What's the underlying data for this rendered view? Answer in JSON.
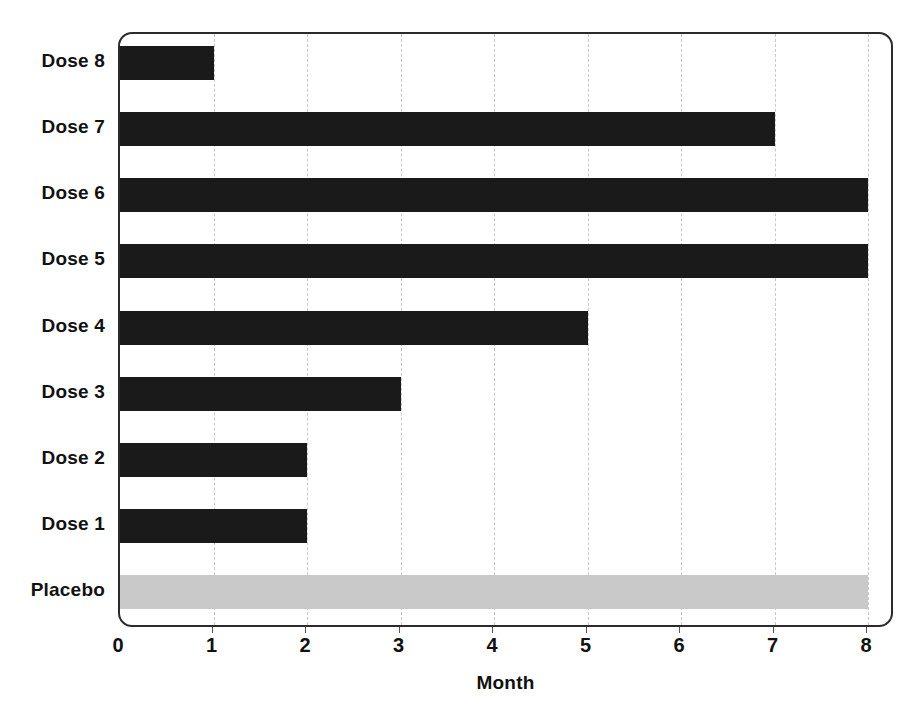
{
  "chart_data": {
    "type": "bar",
    "orientation": "horizontal",
    "title": "",
    "subtitle": "",
    "xlabel": "Month",
    "ylabel": "",
    "categories": [
      "Placebo",
      "Dose 1",
      "Dose 2",
      "Dose 3",
      "Dose 4",
      "Dose 5",
      "Dose 6",
      "Dose 7",
      "Dose 8"
    ],
    "values": [
      8,
      2,
      2,
      3,
      5,
      8,
      8,
      7,
      1
    ],
    "bar_colors": [
      "#c9c9c9",
      "#1a1a1a",
      "#1a1a1a",
      "#1a1a1a",
      "#1a1a1a",
      "#1a1a1a",
      "#1a1a1a",
      "#1a1a1a",
      "#1a1a1a"
    ],
    "xlim": [
      0,
      8
    ],
    "xticks": [
      0,
      1,
      2,
      3,
      4,
      5,
      6,
      7,
      8
    ],
    "xtick_labels": [
      "0",
      "1",
      "2",
      "3",
      "4",
      "5",
      "6",
      "7",
      "8"
    ],
    "grid": {
      "vertical": true,
      "horizontal": false,
      "style": "dashed",
      "color": "#c9c9c9"
    },
    "legend": {
      "visible": false,
      "entries": []
    },
    "annotations": [],
    "frame": {
      "border_color": "#2b2b2b",
      "rounded": true,
      "background": "#ffffff"
    }
  },
  "axis": {
    "x_title": "Month",
    "tick_labels": [
      "0",
      "1",
      "2",
      "3",
      "4",
      "5",
      "6",
      "7",
      "8"
    ]
  },
  "categories": [
    {
      "label": "Dose 8",
      "value": 1,
      "series": "dose",
      "name": "bar-dose-8"
    },
    {
      "label": "Dose 7",
      "value": 7,
      "series": "dose",
      "name": "bar-dose-7"
    },
    {
      "label": "Dose 6",
      "value": 8,
      "series": "dose",
      "name": "bar-dose-6"
    },
    {
      "label": "Dose 5",
      "value": 8,
      "series": "dose",
      "name": "bar-dose-5"
    },
    {
      "label": "Dose 4",
      "value": 5,
      "series": "dose",
      "name": "bar-dose-4"
    },
    {
      "label": "Dose 3",
      "value": 3,
      "series": "dose",
      "name": "bar-dose-3"
    },
    {
      "label": "Dose 2",
      "value": 2,
      "series": "dose",
      "name": "bar-dose-2"
    },
    {
      "label": "Dose 1",
      "value": 2,
      "series": "dose",
      "name": "bar-dose-1"
    },
    {
      "label": "Placebo",
      "value": 8,
      "series": "placebo",
      "name": "bar-placebo"
    }
  ],
  "colors": {
    "dose_bar": "#1a1a1a",
    "placebo_bar": "#c9c9c9",
    "gridline": "#c9c9c9",
    "frame_border": "#2b2b2b",
    "text": "#111111",
    "background": "#ffffff"
  }
}
